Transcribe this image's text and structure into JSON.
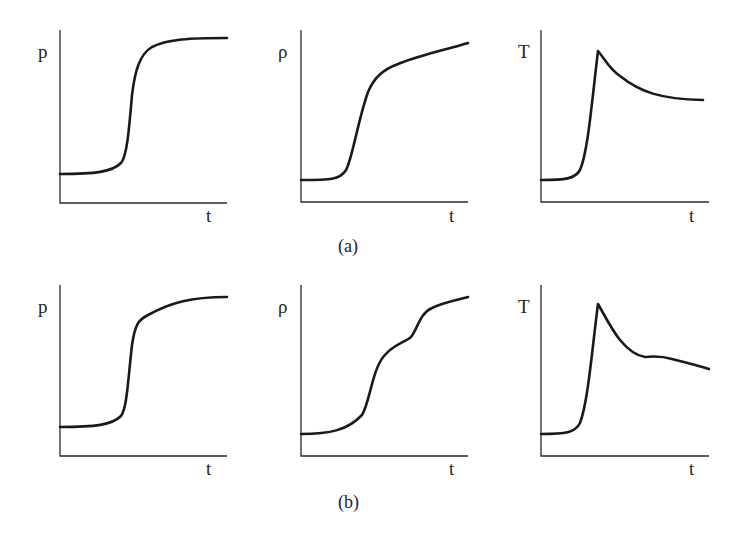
{
  "figure": {
    "captions": {
      "a": "(a)",
      "b": "(b)"
    },
    "x_label": "t"
  },
  "panels": [
    {
      "id": "a-pressure",
      "row": "a",
      "ylabel": "p",
      "xlabel": "t",
      "axis": {
        "x": 60,
        "top": 30,
        "bottom": 203,
        "right": 227
      },
      "ylabel_pos": [
        38,
        58
      ],
      "xlabel_pos": [
        206,
        222
      ],
      "path": "M60 174 C 95 174, 112 172, 121 163 C 127 156, 129 130, 132 95 C 135 70, 140 54, 152 47 C 168 39, 190 38, 227 38"
    },
    {
      "id": "a-density",
      "row": "a",
      "ylabel": "ρ",
      "xlabel": "t",
      "axis": {
        "x": 301,
        "top": 30,
        "bottom": 202,
        "right": 468
      },
      "ylabel_pos": [
        278,
        58
      ],
      "xlabel_pos": [
        449,
        222
      ],
      "path": "M301 180 C 330 180, 340 180, 346 170 C 352 160, 358 120, 368 92 C 374 78, 382 70, 398 64 C 420 55, 445 50, 468 43"
    },
    {
      "id": "a-temperature",
      "row": "a",
      "ylabel": "T",
      "xlabel": "t",
      "axis": {
        "x": 541,
        "top": 30,
        "bottom": 202,
        "right": 709
      },
      "ylabel_pos": [
        518,
        58
      ],
      "xlabel_pos": [
        689,
        222
      ],
      "path": "M541 180 C 565 180, 575 179, 580 170 C 588 152, 592 100, 598 51 C 604 58, 610 70, 620 76 C 640 92, 660 99, 703 100"
    },
    {
      "id": "b-pressure",
      "row": "b",
      "ylabel": "p",
      "xlabel": "t",
      "axis": {
        "x": 60,
        "top": 285,
        "bottom": 456,
        "right": 227
      },
      "ylabel_pos": [
        38,
        313
      ],
      "xlabel_pos": [
        206,
        475
      ],
      "path": "M60 427 C 95 427, 112 425, 121 416 C 127 408, 128 380, 132 345 C 135 325, 138 320, 148 315 C 170 303, 190 297, 227 297"
    },
    {
      "id": "b-density",
      "row": "b",
      "ylabel": "ρ",
      "xlabel": "t",
      "axis": {
        "x": 301,
        "top": 285,
        "bottom": 456,
        "right": 468
      },
      "ylabel_pos": [
        278,
        313
      ],
      "xlabel_pos": [
        449,
        475
      ],
      "path": "M301 434 C 330 434, 348 430, 362 415 C 370 402, 372 370, 384 356 C 394 344, 404 343, 411 337 C 418 328, 420 313, 432 308 C 445 302, 458 300, 468 297"
    },
    {
      "id": "b-temperature",
      "row": "b",
      "ylabel": "T",
      "xlabel": "t",
      "axis": {
        "x": 541,
        "top": 285,
        "bottom": 456,
        "right": 709
      },
      "ylabel_pos": [
        518,
        313
      ],
      "xlabel_pos": [
        689,
        475
      ],
      "path": "M541 434 C 565 434, 575 433, 580 423 C 588 402, 592 350, 598 304 C 606 318, 612 330, 620 340 C 630 352, 638 356, 645 357 C 655 356, 662 356, 672 359 C 688 363, 700 366, 709 369"
    }
  ],
  "caption_pos": {
    "a": [
      338,
      252
    ],
    "b": [
      338,
      508
    ]
  },
  "colors": {
    "ink": "#1a1a1a",
    "background": "#ffffff"
  }
}
